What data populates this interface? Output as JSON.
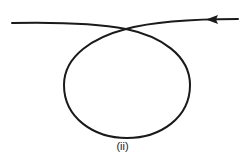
{
  "figure": {
    "label": "(ii)",
    "stroke_color": "#1a1a1a",
    "background": "#ffffff"
  }
}
